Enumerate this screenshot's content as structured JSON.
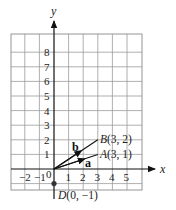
{
  "diagram": {
    "type": "coordinate-grid-vectors",
    "axes": {
      "x_label": "x",
      "y_label": "y",
      "origin_label": "0",
      "x_ticks": [
        "−2",
        "−1",
        "1",
        "2",
        "3",
        "4",
        "5"
      ],
      "y_ticks": [
        "1",
        "2",
        "3",
        "4",
        "5",
        "6",
        "7",
        "8"
      ]
    },
    "grid": {
      "x_min": -3,
      "x_max": 6,
      "y_min": -1.4,
      "y_max": 9
    },
    "points": [
      {
        "name": "A",
        "coords": "(3, 1)",
        "x": 3,
        "y": 1
      },
      {
        "name": "B",
        "coords": "(3, 2)",
        "x": 3,
        "y": 2
      },
      {
        "name": "D",
        "coords": "(0, −1)",
        "x": 0,
        "y": -1
      }
    ],
    "vectors": [
      {
        "label": "a",
        "from": [
          0,
          0
        ],
        "to": [
          3,
          1
        ]
      },
      {
        "label": "b",
        "from": [
          0,
          0
        ],
        "to": [
          3,
          2
        ]
      }
    ],
    "colors": {
      "grid": "#9a9a9a",
      "axis": "#111111",
      "point": "#333333"
    }
  }
}
